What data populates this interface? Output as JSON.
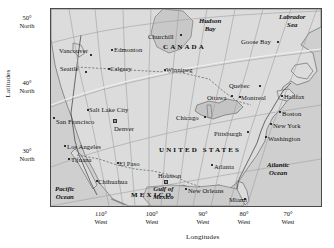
{
  "axes": {
    "latitude_caption": "Latitudes",
    "longitude_caption": "Longitudes",
    "latitude_ticks": [
      {
        "deg": "50°",
        "dir": "North",
        "y": 14
      },
      {
        "deg": "40°",
        "dir": "North",
        "y": 79
      },
      {
        "deg": "30°",
        "dir": "North",
        "y": 147
      }
    ],
    "longitude_ticks": [
      {
        "deg": "110°",
        "dir": "West",
        "x": 101
      },
      {
        "deg": "100°",
        "dir": "West",
        "x": 152
      },
      {
        "deg": "90°",
        "dir": "West",
        "x": 203
      },
      {
        "deg": "80°",
        "dir": "West",
        "x": 244
      },
      {
        "deg": "70°",
        "dir": "West",
        "x": 288
      }
    ]
  },
  "map": {
    "countries": [
      {
        "name": "CANADA",
        "x": 112,
        "y": 38
      },
      {
        "name": "UNITED STATES",
        "x": 118,
        "y": 140
      },
      {
        "name": "MEXICO",
        "x": 80,
        "y": 185
      }
    ],
    "waters": [
      {
        "name": "Hudson|Bay",
        "x": 162,
        "y": 12
      },
      {
        "name": "Labrador|Sea",
        "x": 278,
        "y": 8
      },
      {
        "name": "Atlantic|Ocean",
        "x": 265,
        "y": 158
      },
      {
        "name": "Pacific|Ocean",
        "x": 55,
        "y": 182
      },
      {
        "name": "Gulf of|Mexico",
        "x": 152,
        "y": 181
      }
    ],
    "cities": [
      {
        "name": "Vancouver",
        "lx": 58,
        "ly": 41,
        "dx": 85,
        "dy": 45
      },
      {
        "name": "Seattle",
        "lx": 59,
        "ly": 59,
        "dx": 82,
        "dy": 62
      },
      {
        "name": "Edmonton",
        "lx": 113,
        "ly": 40,
        "dx": 111,
        "dy": 44
      },
      {
        "name": "Calgary",
        "lx": 109,
        "ly": 59,
        "dx": 107,
        "dy": 63
      },
      {
        "name": "Churchill",
        "lx": 147,
        "ly": 27,
        "dx": 178,
        "dy": 29
      },
      {
        "name": "Winnipeg",
        "lx": 165,
        "ly": 60,
        "dx": 163,
        "dy": 64
      },
      {
        "name": "Goose Bay",
        "lx": 240,
        "ly": 32,
        "dx": 275,
        "dy": 35
      },
      {
        "name": "Quebec",
        "lx": 228,
        "ly": 76,
        "dx": 258,
        "dy": 79
      },
      {
        "name": "Ottawa",
        "lx": 206,
        "ly": 88,
        "dx": 203,
        "dy": 91
      },
      {
        "name": "Montreal",
        "lx": 240,
        "ly": 88,
        "dx": 238,
        "dy": 91
      },
      {
        "name": "Halifax",
        "lx": 283,
        "ly": 87,
        "dx": 281,
        "dy": 90
      },
      {
        "name": "Boston",
        "lx": 281,
        "ly": 104,
        "dx": 278,
        "dy": 107
      },
      {
        "name": "New York",
        "lx": 272,
        "ly": 116,
        "dx": 269,
        "dy": 119
      },
      {
        "name": "Washington",
        "lx": 267,
        "ly": 129,
        "dx": 264,
        "dy": 132
      },
      {
        "name": "Chicago",
        "lx": 175,
        "ly": 108,
        "dx": 203,
        "dy": 111
      },
      {
        "name": "Pittsburgh",
        "lx": 213,
        "ly": 124,
        "dx": 246,
        "dy": 126
      },
      {
        "name": "Salt Lake City",
        "lx": 88,
        "ly": 100,
        "dx": 86,
        "dy": 104
      },
      {
        "name": "San Francisco",
        "lx": 55,
        "ly": 112,
        "dx": 52,
        "dy": 112
      },
      {
        "name": "Denver",
        "lx": 113,
        "ly": 119,
        "dx": 111,
        "dy": 117
      },
      {
        "name": "Los Angeles",
        "lx": 66,
        "ly": 137,
        "dx": 63,
        "dy": 140
      },
      {
        "name": "Tijuana",
        "lx": 70,
        "ly": 150,
        "dx": 67,
        "dy": 153
      },
      {
        "name": "El Paso",
        "lx": 118,
        "ly": 154,
        "dx": 116,
        "dy": 157
      },
      {
        "name": "Chihuahua",
        "lx": 97,
        "ly": 172,
        "dx": 95,
        "dy": 175
      },
      {
        "name": "Houston",
        "lx": 157,
        "ly": 166,
        "dx": 163,
        "dy": 174
      },
      {
        "name": "New Orleans",
        "lx": 187,
        "ly": 181,
        "dx": 184,
        "dy": 181
      },
      {
        "name": "Atlanta",
        "lx": 213,
        "ly": 157,
        "dx": 211,
        "dy": 157
      },
      {
        "name": "Miami",
        "lx": 228,
        "ly": 190,
        "dx": 243,
        "dy": 192
      }
    ]
  },
  "colors": {
    "land": "#d9d9d9",
    "ocean": "#cfcfcf",
    "border": "#4a4a4a",
    "graticule": "#9a9a9a",
    "coast": "#5a5a5a"
  }
}
